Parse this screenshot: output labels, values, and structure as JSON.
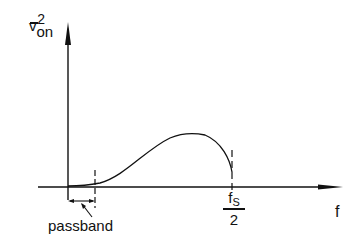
{
  "diagram": {
    "y_axis_label": {
      "base": "v",
      "subscript": "on",
      "superscript": "2",
      "overbar": true
    },
    "x_axis_label": "f",
    "marker_fs_half": {
      "numerator": "f",
      "numerator_sub": "S",
      "denominator": "2"
    },
    "passband_label": "passband",
    "curve": "noise power spectral density rising from zero near passband edge, peaking around mid-band, falling to fs/2",
    "colors": {
      "ink": "#111111",
      "background": "#ffffff"
    }
  }
}
